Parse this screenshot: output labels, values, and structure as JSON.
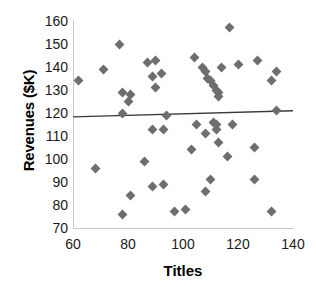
{
  "chart_data": {
    "type": "scatter",
    "title": "",
    "xlabel": "Titles",
    "ylabel": "Revenues ($K)",
    "xlim": [
      60,
      140
    ],
    "ylim": [
      70,
      160
    ],
    "xticks": [
      60,
      80,
      100,
      120,
      140
    ],
    "yticks": [
      70,
      80,
      90,
      100,
      110,
      120,
      130,
      140,
      150,
      160
    ],
    "grid": false,
    "legend": null,
    "marker_color": "#6e6e6e",
    "marker_shape": "diamond",
    "trendline": {
      "type": "linear",
      "color": "#3a3a3a",
      "x": [
        60,
        140
      ],
      "y": [
        118.3,
        121.0
      ]
    },
    "points": [
      {
        "x": 62,
        "y": 134
      },
      {
        "x": 68,
        "y": 96
      },
      {
        "x": 71,
        "y": 139
      },
      {
        "x": 77,
        "y": 150
      },
      {
        "x": 78,
        "y": 120
      },
      {
        "x": 78,
        "y": 129
      },
      {
        "x": 78,
        "y": 76
      },
      {
        "x": 80,
        "y": 125
      },
      {
        "x": 81,
        "y": 128
      },
      {
        "x": 81,
        "y": 84
      },
      {
        "x": 86,
        "y": 99
      },
      {
        "x": 87,
        "y": 142
      },
      {
        "x": 89,
        "y": 136
      },
      {
        "x": 89,
        "y": 113
      },
      {
        "x": 89,
        "y": 88
      },
      {
        "x": 90,
        "y": 143
      },
      {
        "x": 90,
        "y": 131
      },
      {
        "x": 92,
        "y": 137
      },
      {
        "x": 93,
        "y": 113
      },
      {
        "x": 93,
        "y": 89
      },
      {
        "x": 94,
        "y": 119
      },
      {
        "x": 97,
        "y": 77
      },
      {
        "x": 101,
        "y": 78
      },
      {
        "x": 103,
        "y": 104
      },
      {
        "x": 104,
        "y": 144
      },
      {
        "x": 105,
        "y": 115
      },
      {
        "x": 107,
        "y": 140
      },
      {
        "x": 108,
        "y": 138
      },
      {
        "x": 108,
        "y": 111
      },
      {
        "x": 108,
        "y": 86
      },
      {
        "x": 109,
        "y": 135
      },
      {
        "x": 110,
        "y": 134
      },
      {
        "x": 110,
        "y": 91
      },
      {
        "x": 111,
        "y": 132
      },
      {
        "x": 111,
        "y": 116
      },
      {
        "x": 112,
        "y": 130
      },
      {
        "x": 112,
        "y": 113
      },
      {
        "x": 112,
        "y": 115
      },
      {
        "x": 113,
        "y": 127
      },
      {
        "x": 113,
        "y": 129
      },
      {
        "x": 113,
        "y": 107
      },
      {
        "x": 114,
        "y": 140
      },
      {
        "x": 116,
        "y": 101
      },
      {
        "x": 117,
        "y": 157
      },
      {
        "x": 118,
        "y": 115
      },
      {
        "x": 120,
        "y": 141
      },
      {
        "x": 126,
        "y": 105
      },
      {
        "x": 126,
        "y": 91
      },
      {
        "x": 127,
        "y": 143
      },
      {
        "x": 132,
        "y": 77
      },
      {
        "x": 132,
        "y": 134
      },
      {
        "x": 134,
        "y": 138
      },
      {
        "x": 134,
        "y": 121
      }
    ]
  }
}
